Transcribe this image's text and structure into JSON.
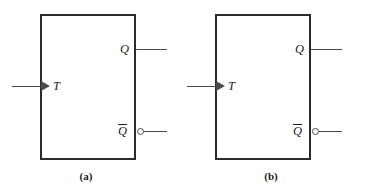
{
  "figure": {
    "line_color": "#4a4a4a",
    "box_border_color": "#2b2b2b",
    "text_color": "#1c1c1c",
    "background": "#ffffff"
  },
  "diagrams": [
    {
      "id": "a",
      "caption": "(a)",
      "inputs": [
        {
          "name": "T",
          "label": "T",
          "edge": "left",
          "dynamic_indicator": true,
          "inverted": false
        }
      ],
      "outputs": [
        {
          "name": "Q",
          "label": "Q",
          "edge": "right",
          "inverted": false
        },
        {
          "name": "Qbar",
          "label": "Q",
          "overbar": true,
          "edge": "right",
          "inverted": true
        }
      ]
    },
    {
      "id": "b",
      "caption": "(b)",
      "inputs": [
        {
          "name": "T",
          "label": "T",
          "edge": "left",
          "dynamic_indicator": true,
          "inverted": false
        }
      ],
      "outputs": [
        {
          "name": "Q",
          "label": "Q",
          "edge": "right",
          "inverted": false
        },
        {
          "name": "Qbar",
          "label": "Q",
          "overbar": true,
          "edge": "right",
          "inverted": true
        }
      ]
    }
  ]
}
